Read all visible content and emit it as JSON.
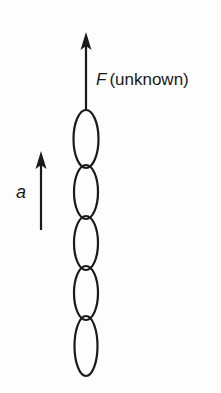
{
  "diagram": {
    "type": "free-body / chain of links",
    "force": {
      "symbol": "F",
      "note": "(unknown)",
      "direction": "up"
    },
    "acceleration": {
      "symbol": "a",
      "direction": "up"
    },
    "chain": {
      "link_count": 5,
      "links": [
        {
          "index": 1,
          "cy": 139,
          "ry": 29
        },
        {
          "index": 2,
          "cy": 192,
          "ry": 27
        },
        {
          "index": 3,
          "cy": 243,
          "ry": 27
        },
        {
          "index": 4,
          "cy": 293,
          "ry": 27
        },
        {
          "index": 5,
          "cy": 346,
          "ry": 30
        }
      ]
    },
    "colors": {
      "ink": "#1a1a1a",
      "background": "#fdfdfd"
    }
  }
}
